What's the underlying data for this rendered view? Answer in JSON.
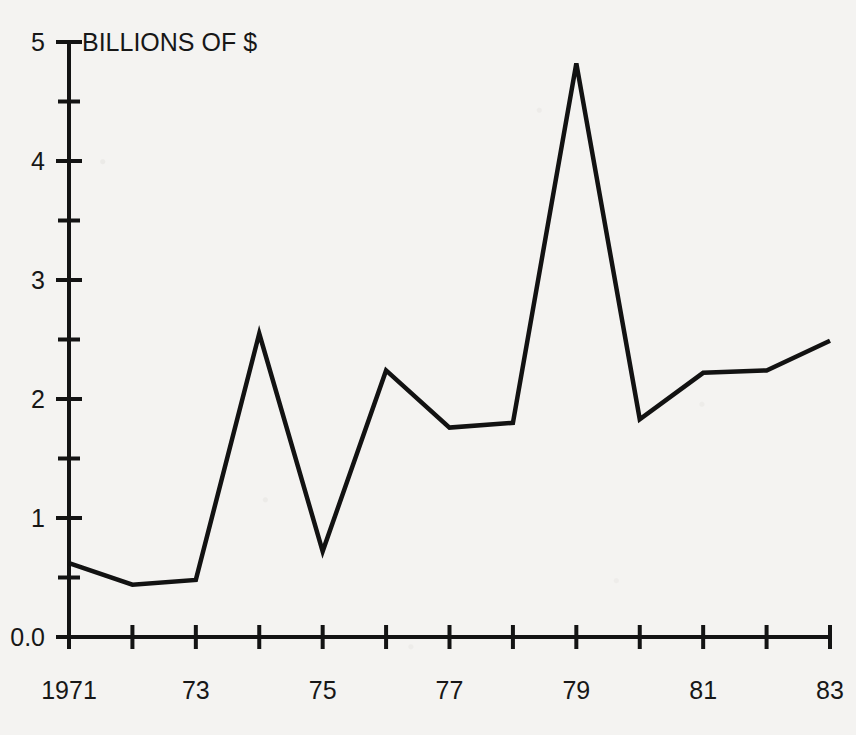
{
  "chart_data": {
    "type": "line",
    "title": "BILLIONS OF $",
    "xlabel": "",
    "ylabel": "",
    "x": [
      1971,
      1972,
      1973,
      1974,
      1975,
      1976,
      1977,
      1978,
      1979,
      1980,
      1981,
      1982,
      1983
    ],
    "values": [
      0.62,
      0.44,
      0.48,
      2.55,
      0.72,
      2.24,
      1.76,
      1.8,
      4.82,
      1.83,
      2.22,
      2.24,
      2.49
    ],
    "series": [
      {
        "name": "BILLIONS OF $",
        "values": [
          0.62,
          0.44,
          0.48,
          2.55,
          0.72,
          2.24,
          1.76,
          1.8,
          4.82,
          1.83,
          2.22,
          2.24,
          2.49
        ]
      }
    ],
    "xlim": [
      1971,
      1983
    ],
    "ylim": [
      0,
      5
    ],
    "grid": false,
    "legend": "none",
    "line_color": "#121212",
    "background_color": "#f4f3f1",
    "y_ticks_major": [
      0,
      1,
      2,
      3,
      4,
      5
    ],
    "y_tick_labels": [
      "0.0",
      "1",
      "2",
      "3",
      "4",
      "5"
    ],
    "y_ticks_minor": [
      0.5,
      1.5,
      2.5,
      3.5,
      4.5
    ],
    "x_ticks": [
      1971,
      1972,
      1973,
      1974,
      1975,
      1976,
      1977,
      1978,
      1979,
      1980,
      1981,
      1982,
      1983
    ],
    "x_tick_labels": [
      "1971",
      "",
      "73",
      "",
      "75",
      "",
      "77",
      "",
      "79",
      "",
      "81",
      "",
      "83"
    ]
  }
}
